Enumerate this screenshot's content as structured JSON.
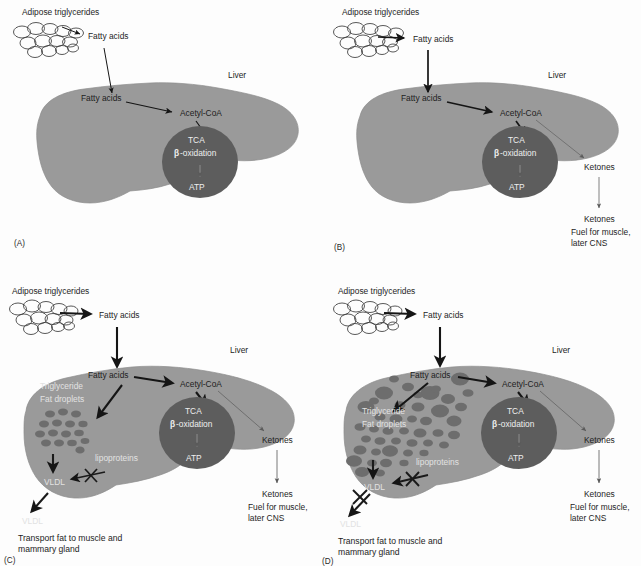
{
  "figure": {
    "panel_count": 4
  },
  "colors": {
    "background": "#fdfdfd",
    "liver_fill": "#9a9a9a",
    "liver_stroke": "#8a8a8a",
    "mitochondrion_fill": "#5d5d5d",
    "droplet_fill": "#6e6e6e",
    "arrow_dark": "#151515",
    "arrow_gray": "#555555",
    "text_dark": "#1d1d1d",
    "text_light": "#efefef"
  },
  "labels": {
    "adipose_triglycerides": "Adipose triglycerides",
    "fatty_acids": "Fatty acids",
    "liver": "Liver",
    "acetyl_coa": "Acetyl-CoA",
    "tca": "TCA",
    "beta_oxidation_prefix": "β",
    "beta_oxidation_suffix": "-oxidation",
    "atp": "ATP",
    "ketones": "Ketones",
    "ketones_fuel_line1": "Fuel for muscle,",
    "ketones_fuel_line2": "later CNS",
    "triglyceride": "Triglyceride",
    "fat_droplets": "Fat droplets",
    "lipoproteins": "lipoproteins",
    "vldl": "VLDL",
    "transport_line1": "Transport fat to muscle and",
    "transport_line2_c": "mammary gland",
    "transport_line2_d": "mammary  gland"
  },
  "panels": [
    {
      "id": "A",
      "panel_label": "(A)",
      "name": "panel-a-fed-state",
      "arrow_weight": "thin",
      "features": {
        "adipose_cluster": true,
        "fatty_acids_external": true,
        "fatty_acids_internal": true,
        "liver_body": true,
        "acetyl_coa": true,
        "mitochondrion": true,
        "ketones": false,
        "fat_droplets": false,
        "lipoproteins": false,
        "vldl": false,
        "blocked_arrows": 0,
        "caption": false
      },
      "visible_text": [
        "Adipose triglycerides",
        "Fatty acids",
        "Liver",
        "Fatty acids",
        "Acetyl-CoA",
        "TCA",
        "β-oxidation",
        "ATP",
        "(A)"
      ]
    },
    {
      "id": "B",
      "panel_label": "(B)",
      "name": "panel-b-ketogenesis",
      "arrow_weight": "medium",
      "features": {
        "adipose_cluster": true,
        "fatty_acids_external": true,
        "fatty_acids_internal": true,
        "liver_body": true,
        "acetyl_coa": true,
        "mitochondrion": true,
        "ketones": true,
        "fat_droplets": false,
        "lipoproteins": false,
        "vldl": false,
        "blocked_arrows": 0,
        "caption": false
      },
      "visible_text": [
        "Adipose triglycerides",
        "Fatty acids",
        "Liver",
        "Fatty acids",
        "Acetyl-CoA",
        "TCA",
        "β-oxidation",
        "ATP",
        "Ketones",
        "Ketones",
        "Fuel for muscle,",
        "later CNS",
        "(B)"
      ]
    },
    {
      "id": "C",
      "panel_label": "(C)",
      "name": "panel-c-vldl-export-blocked",
      "arrow_weight": "thick",
      "droplet_count": 16,
      "droplet_size": "small-uniform",
      "features": {
        "adipose_cluster": true,
        "fatty_acids_external": true,
        "fatty_acids_internal": true,
        "liver_body": true,
        "acetyl_coa": true,
        "mitochondrion": true,
        "ketones": true,
        "fat_droplets": true,
        "lipoproteins": true,
        "vldl": true,
        "blocked_arrows": 1,
        "caption": true
      },
      "visible_text": [
        "Adipose triglycerides",
        "Fatty acids",
        "Liver",
        "Fatty acids",
        "Triglyceride",
        "Fat droplets",
        "Acetyl-CoA",
        "TCA",
        "β-oxidation",
        "ATP",
        "Ketones",
        "lipoproteins",
        "VLDL",
        "VLDL",
        "Ketones",
        "Fuel for muscle,",
        "later CNS",
        "Transport fat to muscle and",
        "mammary gland",
        "(C)"
      ]
    },
    {
      "id": "D",
      "panel_label": "(D)",
      "name": "panel-d-fatty-liver",
      "arrow_weight": "thick",
      "droplet_count": 44,
      "droplet_size": "mixed-large-and-small",
      "features": {
        "adipose_cluster": true,
        "fatty_acids_external": true,
        "fatty_acids_internal": true,
        "liver_body": true,
        "acetyl_coa": true,
        "mitochondrion": true,
        "ketones": true,
        "fat_droplets": true,
        "lipoproteins": true,
        "vldl": true,
        "blocked_arrows": 2,
        "caption": true
      },
      "visible_text": [
        "Adipose triglycerides",
        "Fatty acids",
        "Liver",
        "Fatty acids",
        "Triglyceride",
        "Fat droplets",
        "Acetyl-CoA",
        "TCA",
        "β-oxidation",
        "ATP",
        "Ketones",
        "lipoproteins",
        "VLDL",
        "VLDL",
        "Ketones",
        "Fuel for muscle,",
        "later CNS",
        "Transport fat to muscle and",
        "mammary  gland",
        "(D)"
      ]
    }
  ]
}
